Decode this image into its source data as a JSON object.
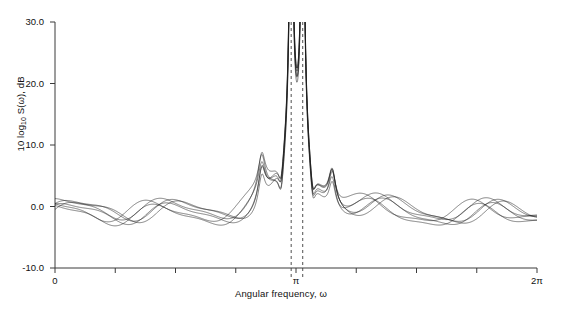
{
  "chart_data": {
    "type": "line",
    "title": "",
    "xlabel": "Angular frequency, ω",
    "ylabel": "10 log₁₀ S(ω), dB",
    "ylabel_parts": {
      "prefix": "10 log",
      "sub": "10",
      "middle": " S(ω), dB"
    },
    "xlim": [
      0,
      6.283185307179586
    ],
    "ylim": [
      -10.0,
      30.0
    ],
    "grid": false,
    "legend": null,
    "xtick_values": [
      0,
      0.7853981633974483,
      1.5707963267948966,
      2.356194490192345,
      3.141592653589793,
      3.9269908169872414,
      4.71238898038469,
      5.497787143782138,
      6.283185307179586
    ],
    "xtick_labels": [
      "0",
      "",
      "",
      "",
      "π",
      "",
      "",
      "",
      "2π"
    ],
    "ytick_values": [
      -10.0,
      0.0,
      10.0,
      20.0,
      30.0
    ],
    "ytick_labels": [
      "-10.0",
      "0.0",
      "10.0",
      "20.0",
      "30.0"
    ],
    "annotations": [
      {
        "name": "peak-marker-left",
        "type": "vertical-dashed-line",
        "x": 3.0787608005179976,
        "label": ""
      },
      {
        "name": "peak-marker-right",
        "type": "vertical-dashed-line",
        "x": 3.2293404496137526,
        "label": ""
      }
    ],
    "series_description": "Ensemble of overlapping periodogram / spectral estimate realizations",
    "n_series": 6,
    "series_color": "#1a1a1a",
    "peaks": [
      {
        "center_x": 3.0787608005179976,
        "peak_value_db": 30.0,
        "clipped": true
      },
      {
        "center_x": 3.2293404496137526,
        "peak_value_db": 30.0,
        "clipped": true
      }
    ],
    "sidelobes": [
      {
        "x": 2.6952,
        "value_db": 3.0
      },
      {
        "x": 3.6137,
        "value_db": 3.0
      }
    ],
    "noise_floor_db": -1.0,
    "ripple_amplitude_db": 1.6,
    "ripple_period": 0.22,
    "series": [
      {
        "name": "estimate-1",
        "offset_db": 0.0,
        "phase": 0.0
      },
      {
        "name": "estimate-2",
        "offset_db": 0.25,
        "phase": 0.35
      },
      {
        "name": "estimate-3",
        "offset_db": -0.3,
        "phase": 0.7
      },
      {
        "name": "estimate-4",
        "offset_db": 0.45,
        "phase": 1.1
      },
      {
        "name": "estimate-5",
        "offset_db": -0.5,
        "phase": 1.55
      },
      {
        "name": "estimate-6",
        "offset_db": 0.15,
        "phase": 2.0
      }
    ]
  }
}
